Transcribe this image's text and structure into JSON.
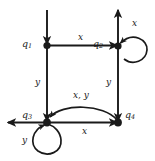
{
  "diagram": {
    "type": "state-transition-diagram",
    "ink_color": "#1a1a1a",
    "background_color": "#ffffff",
    "states": [
      {
        "id": "q1",
        "name": "q",
        "subscript": "1",
        "label": "q1",
        "x": 47,
        "y": 45
      },
      {
        "id": "q2",
        "name": "q",
        "subscript": "2",
        "label": "q2",
        "x": 118,
        "y": 46
      },
      {
        "id": "q3",
        "name": "q",
        "subscript": "3",
        "label": "q3",
        "x": 47,
        "y": 122
      },
      {
        "id": "q4",
        "name": "q",
        "subscript": "4",
        "label": "q4",
        "x": 118,
        "y": 122
      }
    ],
    "edges": [
      {
        "id": "start-into-q1",
        "from": "",
        "to": "q1",
        "label": "",
        "kind": "incoming-start-arrow",
        "direction": "down"
      },
      {
        "id": "q1-to-q2",
        "from": "q1",
        "to": "q2",
        "label": "x",
        "kind": "straight",
        "direction": "right"
      },
      {
        "id": "q1-to-q3",
        "from": "q1",
        "to": "q3",
        "label": "y",
        "kind": "straight",
        "direction": "down"
      },
      {
        "id": "q2-self",
        "from": "q2",
        "to": "q2",
        "label": "x",
        "kind": "self-loop",
        "direction": "right"
      },
      {
        "id": "q2-up",
        "from": "q2",
        "to": "",
        "label": "",
        "kind": "outgoing-arrow",
        "direction": "up"
      },
      {
        "id": "q2-to-q4",
        "from": "q2",
        "to": "q4",
        "label": "y",
        "kind": "straight",
        "direction": "down"
      },
      {
        "id": "q3-to-q4",
        "from": "q3",
        "to": "q4",
        "label": "x",
        "kind": "straight",
        "direction": "right"
      },
      {
        "id": "q4-to-q3",
        "from": "q4",
        "to": "q3",
        "label": "x, y",
        "kind": "curved",
        "direction": "left"
      },
      {
        "id": "q3-self",
        "from": "q3",
        "to": "q3",
        "label": "y",
        "kind": "self-loop",
        "direction": "down"
      },
      {
        "id": "q3-left",
        "from": "q3",
        "to": "",
        "label": "",
        "kind": "outgoing-arrow",
        "direction": "left"
      }
    ],
    "labels": {
      "q1": "q1",
      "q2": "q2",
      "q3": "q3",
      "q4": "q4",
      "q1_q2": "x",
      "q1_q3": "y",
      "q2_self": "x",
      "q2_q4": "y",
      "q3_q4": "x",
      "q4_q3": "x, y",
      "q3_self": "y"
    }
  }
}
